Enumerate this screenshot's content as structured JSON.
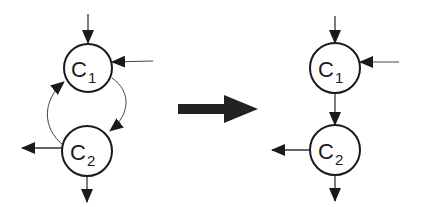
{
  "diagram": {
    "left": {
      "nodes": [
        {
          "id": "c1",
          "label": "C",
          "subscript": "1"
        },
        {
          "id": "c2",
          "label": "C",
          "subscript": "2"
        }
      ],
      "edges": [
        {
          "from": "external",
          "to": "c1",
          "direction": "top-in"
        },
        {
          "from": "external",
          "to": "c1",
          "direction": "right-in"
        },
        {
          "from": "c1",
          "to": "c2",
          "style": "curved-right"
        },
        {
          "from": "c2",
          "to": "c1",
          "style": "curved-left"
        },
        {
          "from": "c2",
          "to": "external",
          "direction": "left-out"
        },
        {
          "from": "c2",
          "to": "external",
          "direction": "bottom-out"
        }
      ]
    },
    "transform_arrow": "right-arrow",
    "right": {
      "nodes": [
        {
          "id": "c1",
          "label": "C",
          "subscript": "1"
        },
        {
          "id": "c2",
          "label": "C",
          "subscript": "2"
        }
      ],
      "edges": [
        {
          "from": "external",
          "to": "c1",
          "direction": "top-in"
        },
        {
          "from": "external",
          "to": "c1",
          "direction": "right-in"
        },
        {
          "from": "c1",
          "to": "c2",
          "style": "straight-down"
        },
        {
          "from": "c2",
          "to": "external",
          "direction": "left-out"
        },
        {
          "from": "c2",
          "to": "external",
          "direction": "bottom-out"
        }
      ]
    },
    "colors": {
      "stroke": "#1a1a1a",
      "arrow": "#222222",
      "background": "#ffffff"
    }
  }
}
